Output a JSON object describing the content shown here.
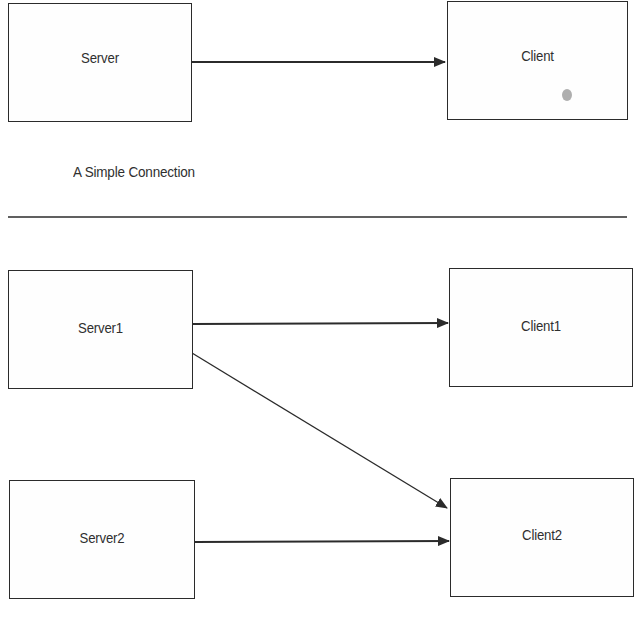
{
  "colors": {
    "stroke": "#2b2b2b",
    "text": "#2f2f2f",
    "background": "#ffffff"
  },
  "simple_connection": {
    "caption": "A Simple Connection",
    "nodes": [
      {
        "id": "server",
        "label": "Server"
      },
      {
        "id": "client",
        "label": "Client"
      }
    ],
    "edges": [
      {
        "from": "Server",
        "to": "Client"
      }
    ]
  },
  "multi_connection": {
    "nodes": [
      {
        "id": "server1",
        "label": "Server1"
      },
      {
        "id": "client1",
        "label": "Client1"
      },
      {
        "id": "server2",
        "label": "Server2"
      },
      {
        "id": "client2",
        "label": "Client2"
      }
    ],
    "edges": [
      {
        "from": "Server1",
        "to": "Client1"
      },
      {
        "from": "Server1",
        "to": "Client2"
      },
      {
        "from": "Server2",
        "to": "Client2"
      }
    ]
  }
}
